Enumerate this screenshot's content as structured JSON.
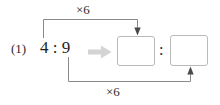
{
  "worksheet": {
    "problem_number": "(1)",
    "given_ratio": {
      "antecedent": "4",
      "separator": ":",
      "consequent": "9",
      "display": "4 : 9"
    },
    "transform_arrow": {
      "icon": "right-arrow-icon",
      "color": "#d4d4d4"
    },
    "answer": {
      "box_1_value": "",
      "box_2_value": "",
      "box_placeholder": "",
      "separator": ":"
    },
    "operations": {
      "top": {
        "label": "×6",
        "operator": "×",
        "factor": "6",
        "target": "answer-box-1",
        "arrow_direction": "down"
      },
      "bottom": {
        "label": "×6",
        "operator": "×",
        "factor": "6",
        "target": "answer-box-2",
        "arrow_direction": "up"
      }
    },
    "colors": {
      "text": "#1e1e1e",
      "line": "#8a8a8a",
      "box_border": "#b9b9b9",
      "arrow_gray": "#d4d4d4",
      "background": "#ffffff"
    }
  }
}
